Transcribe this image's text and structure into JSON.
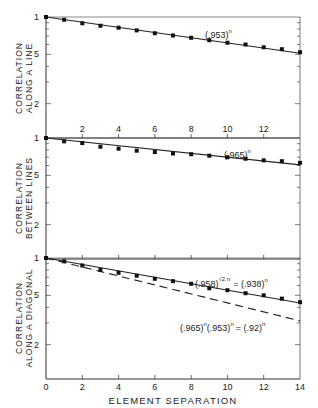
{
  "chart_data": [
    {
      "type": "scatter",
      "panel": "top",
      "ylabel": [
        "CORRELATION",
        "ALONG A LINE"
      ],
      "xlabel": "",
      "yscale": "log",
      "ylim": [
        0.1,
        1
      ],
      "xlim": [
        0,
        14
      ],
      "yticks": [
        {
          "value": 1,
          "label": "1"
        },
        {
          "value": 0.5,
          "label": "5"
        },
        {
          "value": 0.2,
          "label": "2"
        }
      ],
      "xticks_top_of_next": [
        "2",
        "4",
        "6",
        "8",
        "10",
        "12"
      ],
      "series": [
        {
          "name": "measured",
          "kind": "points",
          "x": [
            0,
            1,
            2,
            3,
            4,
            5,
            6,
            7,
            8,
            9,
            10,
            11,
            12,
            13,
            14
          ],
          "y": [
            1.0,
            0.95,
            0.89,
            0.85,
            0.82,
            0.78,
            0.74,
            0.71,
            0.68,
            0.65,
            0.62,
            0.6,
            0.57,
            0.55,
            0.52
          ]
        },
        {
          "name": "(.953)^n",
          "kind": "line",
          "base": 0.953
        }
      ],
      "annotations": [
        {
          "text": "(.953)",
          "sup": "n",
          "x": 9.1,
          "y": 0.78
        }
      ]
    },
    {
      "type": "scatter",
      "panel": "middle",
      "ylabel": [
        "CORRELATION",
        "BETWEEN LINES"
      ],
      "yscale": "log",
      "ylim": [
        0.1,
        1
      ],
      "xlim": [
        0,
        14
      ],
      "yticks": [
        {
          "value": 1,
          "label": "1"
        },
        {
          "value": 0.5,
          "label": "5"
        },
        {
          "value": 0.2,
          "label": "2"
        }
      ],
      "series": [
        {
          "name": "measured",
          "kind": "points",
          "x": [
            0,
            1,
            2,
            3,
            4,
            5,
            6,
            7,
            8,
            9,
            10,
            11,
            12,
            13,
            14
          ],
          "y": [
            1.0,
            0.94,
            0.91,
            0.85,
            0.82,
            0.79,
            0.77,
            0.75,
            0.74,
            0.72,
            0.7,
            0.68,
            0.66,
            0.65,
            0.63
          ]
        },
        {
          "name": "(.965)^n",
          "kind": "line",
          "base": 0.965
        }
      ],
      "annotations": [
        {
          "text": "(.965)",
          "sup": "n",
          "x": 10.2,
          "y": 0.82
        }
      ]
    },
    {
      "type": "scatter",
      "panel": "bottom",
      "ylabel": [
        "CORRELATION",
        "ALONG A DIAGONAL"
      ],
      "xlabel": "ELEMENT SEPARATION",
      "yscale": "log",
      "ylim": [
        0.1,
        1
      ],
      "xlim": [
        0,
        14
      ],
      "xticks": [
        "0",
        "2",
        "4",
        "6",
        "8",
        "10",
        "12",
        "14"
      ],
      "yticks": [
        {
          "value": 1,
          "label": "1"
        },
        {
          "value": 0.5,
          "label": "5"
        },
        {
          "value": 0.2,
          "label": "2"
        }
      ],
      "series": [
        {
          "name": "measured",
          "kind": "points",
          "x": [
            0,
            1,
            2,
            3,
            4,
            5,
            6,
            7,
            8,
            9,
            10,
            11,
            12,
            13,
            14
          ],
          "y": [
            1.0,
            0.94,
            0.87,
            0.8,
            0.76,
            0.72,
            0.68,
            0.65,
            0.62,
            0.57,
            0.55,
            0.52,
            0.5,
            0.47,
            0.44
          ]
        },
        {
          "name": "(.958)^(√2 n) = (.938)^n",
          "kind": "line",
          "style": "solid",
          "base": 0.942
        },
        {
          "name": "(.965)^n(.953)^n = (.92)^n",
          "kind": "line",
          "style": "dashed",
          "base": 0.92
        }
      ],
      "annotations": [
        {
          "text": "(.958)",
          "sup": "√2 n",
          "rest": " = (.938)",
          "sup2": "n",
          "x": 8.2,
          "y": 0.72
        },
        {
          "text": "(.965)",
          "sup": "n",
          "rest": "(.953)",
          "sup2": "n",
          "tail": " = (.92)",
          "sup3": "n",
          "x": 7.0,
          "y": 0.39
        }
      ]
    }
  ],
  "labels": {
    "xlabel": "ELEMENT SEPARATION",
    "panel1_y1": "CORRELATION",
    "panel1_y2": "ALONG A LINE",
    "panel2_y1": "CORRELATION",
    "panel2_y2": "BETWEEN LINES",
    "panel3_y1": "CORRELATION",
    "panel3_y2": "ALONG A DIAGONAL",
    "p1_annot": "(.953)",
    "p1_sup": "n",
    "p2_annot": "(.965)",
    "p2_sup": "n",
    "p3_annot_a": "(.958)",
    "p3_sup_a": "√2 n",
    "p3_annot_a2": "= (.938)",
    "p3_sup_a2": "n",
    "p3_annot_b": "(.965)",
    "p3_sup_b": "n",
    "p3_annot_b2": "(.953)",
    "p3_sup_b2": "n",
    "p3_annot_b3": "= (.92)",
    "p3_sup_b3": "n"
  }
}
